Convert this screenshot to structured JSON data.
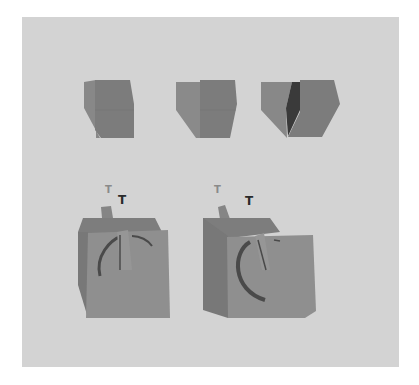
{
  "figure": {
    "background_color": "#ffffff",
    "panel_color": "#d3d3d3",
    "top_row": {
      "objects": [
        {
          "name": "cube-1",
          "front_color": "#7c7c7c",
          "side_color": "#8a8a8a"
        },
        {
          "name": "cube-2",
          "front_color": "#7c7c7c",
          "side_color": "#8a8a8a"
        },
        {
          "name": "cube-3",
          "front_color": "#7c7c7c",
          "side_color": "#8a8a8a",
          "notch_color": "#3a3a3a"
        }
      ]
    },
    "bottom_row": {
      "objects": [
        {
          "name": "dial-block-1",
          "label_light": "T",
          "label_dark": "T"
        },
        {
          "name": "dial-block-2",
          "label_light": "T",
          "label_dark": "T"
        }
      ],
      "colors": {
        "back": "#7d7d7d",
        "front": "#8f8f8f",
        "groove": "#4a4a4a"
      }
    }
  }
}
